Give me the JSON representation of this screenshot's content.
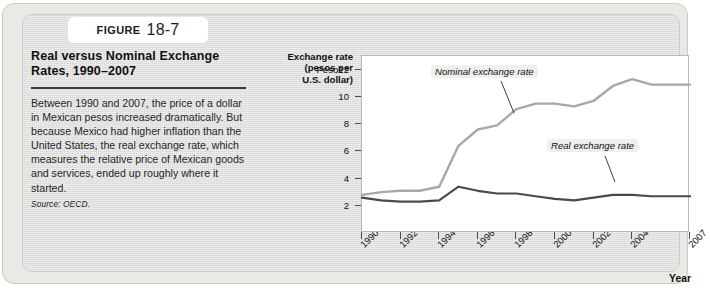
{
  "figure": {
    "tab_word": "FIGURE",
    "tab_number": "18-7",
    "title": "Real versus Nominal Exchange Rates, 1990–2007",
    "body": "Between 1990 and 2007, the price of a dollar in Mexican pesos increased dramatically. But because Mexico had higher inflation than the United States, the real exchange rate, which measures the relative price of Mexican goods and services, ended up roughly where it started.",
    "source": "Source: OECD."
  },
  "colors": {
    "nominal_line": "#a8a8a8",
    "real_line": "#4a4a4a",
    "panel_background": "#dedede",
    "frame_background": "#e9e9e6",
    "plot_background": "#ffffff",
    "axis": "#4a4a4a"
  },
  "chart_data": {
    "type": "line",
    "title": "Real versus Nominal Exchange Rates, 1990–2007",
    "xlabel": "Year",
    "ylabel": "Exchange rate (pesos per U.S. dollar)",
    "ylabel_lines": [
      "Exchange rate",
      "(pesos per",
      "U.S. dollar)"
    ],
    "xlim": [
      1990,
      2007
    ],
    "ylim": [
      0,
      13
    ],
    "grid": false,
    "legend_position": "inline-annotations",
    "y_ticks": [
      2,
      4,
      6,
      8,
      10,
      12
    ],
    "y_tick_labels": [
      "2",
      "4",
      "6",
      "8",
      "10",
      "Peso12"
    ],
    "x_ticks": [
      1990,
      1992,
      1994,
      1996,
      1998,
      2000,
      2002,
      2004,
      2007
    ],
    "x_tick_labels": [
      "1990",
      "1992",
      "1994",
      "1996",
      "1998",
      "2000",
      "2002",
      "2004",
      "2007"
    ],
    "x": [
      1990,
      1991,
      1992,
      1993,
      1994,
      1995,
      1996,
      1997,
      1998,
      1999,
      2000,
      2001,
      2002,
      2003,
      2004,
      2005,
      2006,
      2007
    ],
    "series": [
      {
        "name": "Nominal exchange rate",
        "color": "#a8a8a8",
        "values": [
          2.8,
          3.0,
          3.1,
          3.1,
          3.4,
          6.4,
          7.6,
          7.9,
          9.1,
          9.5,
          9.5,
          9.3,
          9.7,
          10.8,
          11.3,
          10.9,
          10.9,
          10.9
        ]
      },
      {
        "name": "Real exchange rate",
        "color": "#4a4a4a",
        "values": [
          2.6,
          2.4,
          2.3,
          2.3,
          2.4,
          3.4,
          3.1,
          2.9,
          2.9,
          2.7,
          2.5,
          2.4,
          2.6,
          2.8,
          2.8,
          2.7,
          2.7,
          2.7
        ]
      }
    ],
    "annotations": [
      {
        "text": "Nominal exchange rate",
        "x": 1996.2,
        "y": 12.2
      },
      {
        "text": "Real exchange rate",
        "x": 2001.4,
        "y": 5.2
      }
    ]
  }
}
